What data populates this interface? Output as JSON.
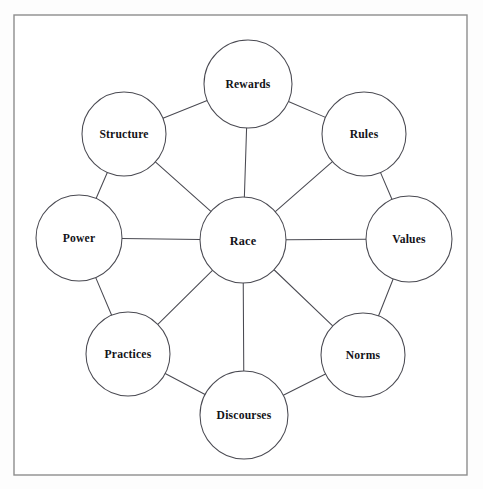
{
  "diagram": {
    "type": "hub-and-spoke-ring",
    "frame": {
      "x": 14,
      "y": 15,
      "width": 453,
      "height": 460
    },
    "canvas": {
      "width": 483,
      "height": 489
    },
    "colors": {
      "background": "#ffffff",
      "frame_stroke": "#8d8d8d",
      "node_stroke": "#4a4a52",
      "node_fill": "#ffffff",
      "edge_stroke": "#4a4a52",
      "label_text": "#131318"
    },
    "hub": {
      "id": "race",
      "label": "Race",
      "cx": 243,
      "cy": 240,
      "r": 43
    },
    "nodes": [
      {
        "id": "rewards",
        "label": "Rewards",
        "cx": 248,
        "cy": 84,
        "r": 44,
        "position": "top"
      },
      {
        "id": "rules",
        "label": "Rules",
        "cx": 364,
        "cy": 134,
        "r": 42,
        "position": "top-right"
      },
      {
        "id": "values",
        "label": "Values",
        "cx": 409,
        "cy": 239,
        "r": 43,
        "position": "right"
      },
      {
        "id": "norms",
        "label": "Norms",
        "cx": 363,
        "cy": 355,
        "r": 42,
        "position": "bottom-right"
      },
      {
        "id": "discourses",
        "label": "Discourses",
        "cx": 244,
        "cy": 415,
        "r": 44,
        "position": "bottom"
      },
      {
        "id": "practices",
        "label": "Practices",
        "cx": 128,
        "cy": 354,
        "r": 42,
        "position": "bottom-left"
      },
      {
        "id": "power",
        "label": "Power",
        "cx": 79,
        "cy": 238,
        "r": 43,
        "position": "left"
      },
      {
        "id": "structure",
        "label": "Structure",
        "cx": 124,
        "cy": 134,
        "r": 42,
        "position": "top-left"
      }
    ],
    "spokes": [
      {
        "from": "race",
        "to": "rewards"
      },
      {
        "from": "race",
        "to": "rules"
      },
      {
        "from": "race",
        "to": "values"
      },
      {
        "from": "race",
        "to": "norms"
      },
      {
        "from": "race",
        "to": "discourses"
      },
      {
        "from": "race",
        "to": "practices"
      },
      {
        "from": "race",
        "to": "power"
      },
      {
        "from": "race",
        "to": "structure"
      }
    ],
    "ring_edges": [
      {
        "from": "rewards",
        "to": "rules"
      },
      {
        "from": "rules",
        "to": "values"
      },
      {
        "from": "values",
        "to": "norms"
      },
      {
        "from": "norms",
        "to": "discourses"
      },
      {
        "from": "discourses",
        "to": "practices"
      },
      {
        "from": "practices",
        "to": "power"
      },
      {
        "from": "power",
        "to": "structure"
      },
      {
        "from": "structure",
        "to": "rewards"
      }
    ]
  }
}
